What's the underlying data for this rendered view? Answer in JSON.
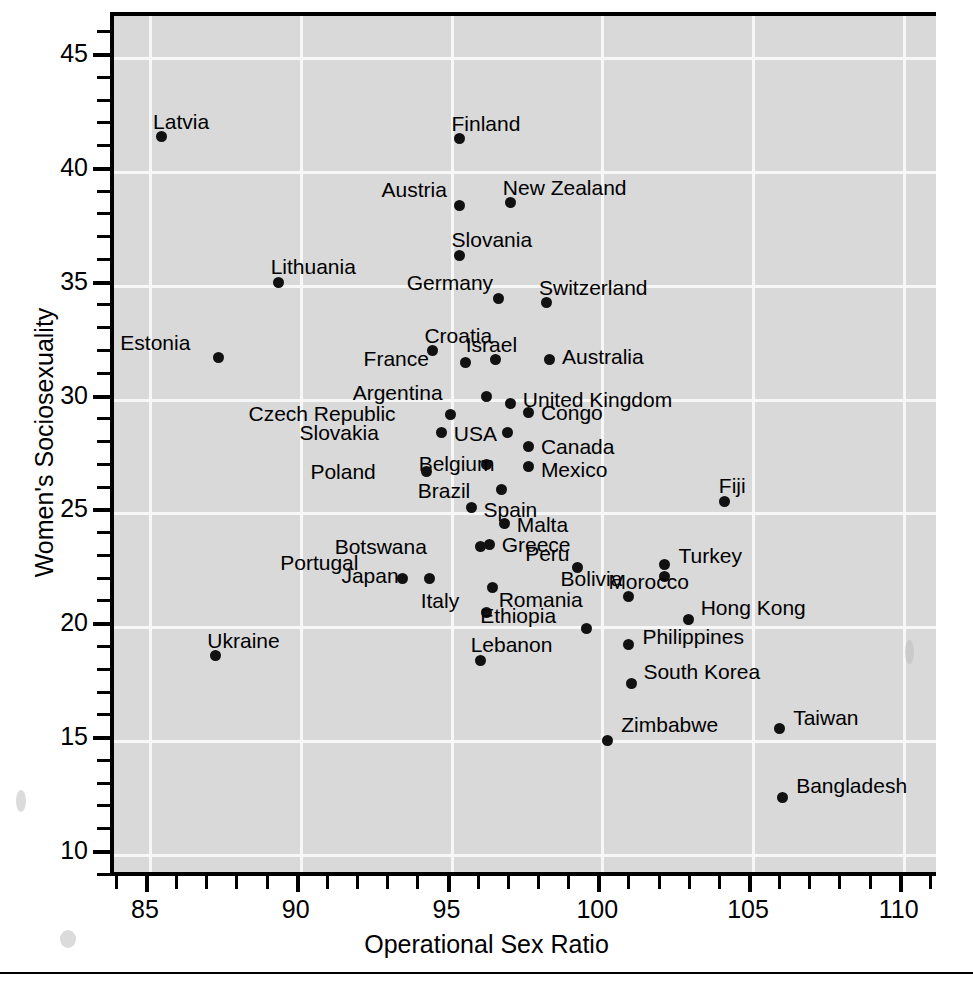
{
  "chart_data": {
    "type": "scatter",
    "title": "",
    "xlabel": "Operational Sex Ratio",
    "ylabel": "Women's Sociosexuality",
    "xlim": [
      83.8,
      111.0
    ],
    "ylim": [
      8.6,
      46.9
    ],
    "xticks": [
      85,
      90,
      95,
      100,
      105,
      110
    ],
    "yticks": [
      10,
      15,
      20,
      25,
      30,
      35,
      40,
      45
    ],
    "xtick_labels": [
      "85",
      "90",
      "95",
      "100",
      "105",
      "110"
    ],
    "ytick_labels": [
      "10",
      "15",
      "20",
      "25",
      "30",
      "35",
      "40",
      "45"
    ],
    "minor_tick_step_x": 1,
    "minor_tick_step_y": 1,
    "grid": true,
    "legend": "none",
    "point_color": "#111111",
    "plot_background": "#d9d9d9",
    "gridline_color": "#f7f7f7",
    "points": [
      {
        "label": "Latvia",
        "x": 85.4,
        "y": 41.5,
        "lx": -8,
        "ly": -26
      },
      {
        "label": "Finland",
        "x": 95.3,
        "y": 41.4,
        "lx": -8,
        "ly": -26
      },
      {
        "label": "New Zealand",
        "x": 97.0,
        "y": 38.6,
        "lx": -8,
        "ly": -26
      },
      {
        "label": "Austria",
        "x": 95.3,
        "y": 38.5,
        "lx": -78,
        "ly": -26
      },
      {
        "label": "Slovania",
        "x": 95.3,
        "y": 36.3,
        "lx": -8,
        "ly": -26
      },
      {
        "label": "Lithuania",
        "x": 89.3,
        "y": 35.1,
        "lx": -8,
        "ly": -26
      },
      {
        "label": "Germany",
        "x": 96.6,
        "y": 34.4,
        "lx": -92,
        "ly": -26
      },
      {
        "label": "Switzerland",
        "x": 98.2,
        "y": 34.2,
        "lx": -8,
        "ly": -26
      },
      {
        "label": "Croatia",
        "x": 94.4,
        "y": 32.1,
        "lx": -8,
        "ly": -26
      },
      {
        "label": "Israel",
        "x": 96.5,
        "y": 31.7,
        "lx": -30,
        "ly": -26
      },
      {
        "label": "Estonia",
        "x": 87.3,
        "y": 31.8,
        "lx": -98,
        "ly": -26
      },
      {
        "label": "Australia",
        "x": 98.3,
        "y": 31.7,
        "lx": 12,
        "ly": -14
      },
      {
        "label": "France",
        "x": 95.5,
        "y": 31.6,
        "lx": -102,
        "ly": -14
      },
      {
        "label": "Argentina",
        "x": 96.2,
        "y": 30.1,
        "lx": -134,
        "ly": -14
      },
      {
        "label": "United Kingdom",
        "x": 97.0,
        "y": 29.8,
        "lx": 12,
        "ly": -14
      },
      {
        "label": "Congo",
        "x": 97.6,
        "y": 29.4,
        "lx": 12,
        "ly": -10
      },
      {
        "label": "Czech Republic",
        "x": 95.0,
        "y": 29.3,
        "lx": -202,
        "ly": -11
      },
      {
        "label": "USA",
        "x": 96.9,
        "y": 28.5,
        "lx": -54,
        "ly": -10
      },
      {
        "label": "Canada",
        "x": 97.6,
        "y": 27.9,
        "lx": 12,
        "ly": -10
      },
      {
        "label": "Slovakia",
        "x": 94.7,
        "y": 28.5,
        "lx": -142,
        "ly": -11
      },
      {
        "label": "Belgium",
        "x": 96.2,
        "y": 27.1,
        "lx": -68,
        "ly": -12
      },
      {
        "label": "Poland",
        "x": 94.2,
        "y": 26.8,
        "lx": -116,
        "ly": -10
      },
      {
        "label": "Mexico",
        "x": 97.6,
        "y": 27.0,
        "lx": 12,
        "ly": -8
      },
      {
        "label": "Fiji",
        "x": 104.1,
        "y": 25.5,
        "lx": -6,
        "ly": -26
      },
      {
        "label": "Brazil",
        "x": 96.7,
        "y": 26.0,
        "lx": -84,
        "ly": -10
      },
      {
        "label": "Spain",
        "x": 95.7,
        "y": 25.2,
        "lx": 12,
        "ly": -9
      },
      {
        "label": "Malta",
        "x": 96.8,
        "y": 24.5,
        "lx": 12,
        "ly": -10
      },
      {
        "label": "Greece",
        "x": 96.3,
        "y": 23.6,
        "lx": 12,
        "ly": -10
      },
      {
        "label": "Botswana",
        "x": 96.0,
        "y": 23.5,
        "lx": -146,
        "ly": -11
      },
      {
        "label": "Turkey",
        "x": 102.1,
        "y": 22.7,
        "lx": 14,
        "ly": -20
      },
      {
        "label": "Peru",
        "x": 99.2,
        "y": 22.6,
        "lx": -52,
        "ly": -24
      },
      {
        "label": "Bolivia",
        "x": 102.1,
        "y": 22.2,
        "lx": -104,
        "ly": -8
      },
      {
        "label": "Portugal",
        "x": 93.4,
        "y": 22.1,
        "lx": -122,
        "ly": -26
      },
      {
        "label": "Japan",
        "x": 94.3,
        "y": 22.1,
        "lx": -88,
        "ly": -13
      },
      {
        "label": "Italy",
        "x": 96.4,
        "y": 21.7,
        "lx": -72,
        "ly": 2
      },
      {
        "label": "Morocco",
        "x": 100.9,
        "y": 21.3,
        "lx": -20,
        "ly": -26
      },
      {
        "label": "Romania",
        "x": 96.2,
        "y": 20.6,
        "lx": 12,
        "ly": -24
      },
      {
        "label": "Hong Kong",
        "x": 102.9,
        "y": 20.3,
        "lx": 12,
        "ly": -22
      },
      {
        "label": "Ethiopia",
        "x": 99.5,
        "y": 19.9,
        "lx": -106,
        "ly": -24
      },
      {
        "label": "Philippines",
        "x": 100.9,
        "y": 19.2,
        "lx": 14,
        "ly": -18
      },
      {
        "label": "Ukraine",
        "x": 87.2,
        "y": 18.7,
        "lx": -8,
        "ly": -26
      },
      {
        "label": "Lebanon",
        "x": 96.0,
        "y": 18.5,
        "lx": -10,
        "ly": -26
      },
      {
        "label": "South Korea",
        "x": 101.0,
        "y": 17.5,
        "lx": 12,
        "ly": -22
      },
      {
        "label": "Taiwan",
        "x": 105.9,
        "y": 15.5,
        "lx": 14,
        "ly": -22
      },
      {
        "label": "Zimbabwe",
        "x": 100.2,
        "y": 15.0,
        "lx": 14,
        "ly": -26
      },
      {
        "label": "Bangladesh",
        "x": 106.0,
        "y": 12.5,
        "lx": 14,
        "ly": -22
      }
    ]
  }
}
